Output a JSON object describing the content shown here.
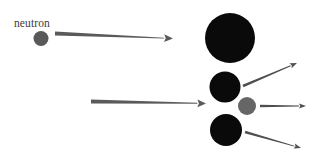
{
  "diagram": {
    "background_color": "#ffffff",
    "width": 327,
    "height": 162,
    "labels": [
      {
        "id": "neutron-label",
        "text": "neutron",
        "x": 14,
        "y": 27,
        "color": "#3d3d3d",
        "font_size": 11.5
      }
    ],
    "particles": [
      {
        "id": "incoming-neutron",
        "name": "neutron",
        "shape": "circle",
        "cx": 41,
        "cy": 38.5,
        "r": 7.5,
        "color": "#595959"
      },
      {
        "id": "target-nucleus",
        "name": "heavy-nucleus",
        "shape": "circle",
        "cx": 230,
        "cy": 38,
        "r": 25,
        "color": "#0a0a0a"
      },
      {
        "id": "fission-fragment-upper",
        "name": "fission-fragment",
        "shape": "circle",
        "cx": 225,
        "cy": 87,
        "r": 15.5,
        "color": "#0a0a0a"
      },
      {
        "id": "emitted-neutron",
        "name": "neutron",
        "shape": "circle",
        "cx": 247,
        "cy": 106,
        "r": 9,
        "color": "#666666"
      },
      {
        "id": "fission-fragment-lower",
        "name": "fission-fragment",
        "shape": "circle",
        "cx": 226,
        "cy": 130,
        "r": 16,
        "color": "#0a0a0a"
      }
    ],
    "arrows": [
      {
        "id": "incoming-neutron-arrow",
        "name": "neutron-trajectory-top",
        "x1": 55,
        "y1": 33.5,
        "x2": 173,
        "y2": 38.5,
        "tail_width": 4.2,
        "head_width": 1.0,
        "color": "#5a5a5a",
        "direction": "right"
      },
      {
        "id": "incoming-beam-arrow",
        "name": "neutron-trajectory-middle",
        "x1": 91,
        "y1": 101.5,
        "x2": 206,
        "y2": 103.5,
        "tail_width": 4.0,
        "head_width": 1.0,
        "color": "#5a5a5a",
        "direction": "right"
      },
      {
        "id": "outgoing-arrow-upper",
        "name": "fragment-trajectory-upper-right",
        "x1": 243,
        "y1": 86,
        "x2": 297,
        "y2": 63,
        "tail_width": 2.6,
        "head_width": 0.9,
        "color": "#4f4f4f",
        "direction": "up-right"
      },
      {
        "id": "outgoing-arrow-middle",
        "name": "neutron-trajectory-right",
        "x1": 260,
        "y1": 106,
        "x2": 306,
        "y2": 106,
        "tail_width": 2.6,
        "head_width": 0.9,
        "color": "#4f4f4f",
        "direction": "right"
      },
      {
        "id": "outgoing-arrow-lower",
        "name": "fragment-trajectory-lower-right",
        "x1": 245,
        "y1": 132,
        "x2": 301,
        "y2": 148,
        "tail_width": 2.6,
        "head_width": 0.9,
        "color": "#4f4f4f",
        "direction": "down-right"
      }
    ]
  }
}
